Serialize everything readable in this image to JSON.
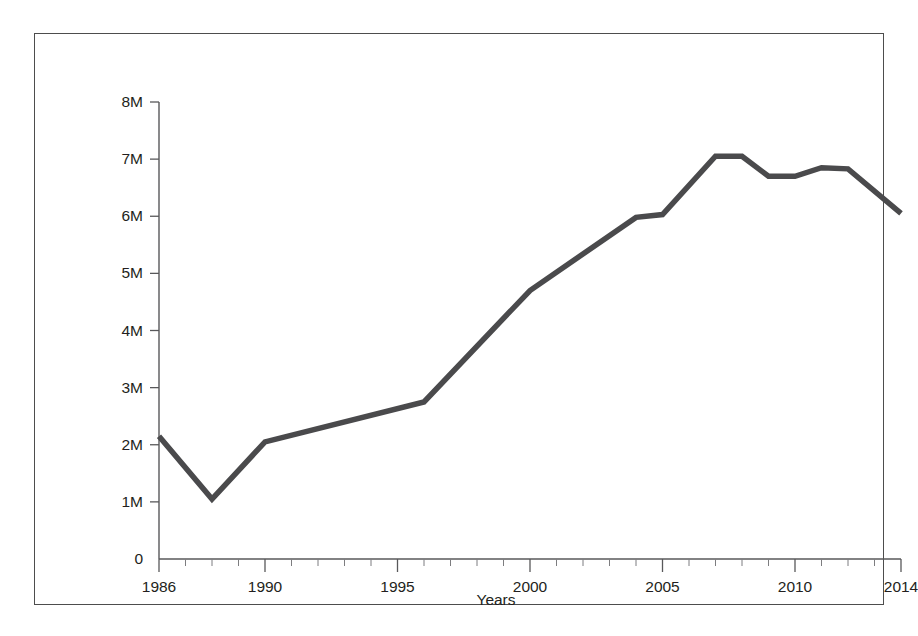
{
  "chart_data": {
    "type": "line",
    "title": "",
    "subtitle": "",
    "xlabel": "Years",
    "ylabel": "",
    "xlim": [
      1986,
      2014
    ],
    "ylim": [
      0,
      8000000
    ],
    "grid": false,
    "legend": null,
    "y_tick_values": [
      0,
      1000000,
      2000000,
      3000000,
      4000000,
      5000000,
      6000000,
      7000000,
      8000000
    ],
    "y_tick_labels": [
      "0",
      "1M",
      "2M",
      "3M",
      "4M",
      "5M",
      "6M",
      "7M",
      "8M"
    ],
    "x_tick_values": [
      1986,
      1990,
      1995,
      2000,
      2005,
      2010,
      2014
    ],
    "x_tick_labels": [
      "1986",
      "1990",
      "1995",
      "2000",
      "2005",
      "2010",
      "2014"
    ],
    "x_minor_ticks": [
      1987,
      1988,
      1989,
      1991,
      1992,
      1993,
      1994,
      1996,
      1997,
      1998,
      1999,
      2001,
      2002,
      2003,
      2004,
      2006,
      2007,
      2008,
      2009,
      2011,
      2012,
      2013
    ],
    "line_color": "#4a4a4c",
    "line_width": 5.5,
    "series": [
      {
        "name": "Series 1",
        "x": [
          1986,
          1988,
          1990,
          1996,
          2000,
          2004,
          2005,
          2007,
          2008,
          2009,
          2010,
          2011,
          2012,
          2014
        ],
        "values": [
          2150000,
          1050000,
          2050000,
          2750000,
          4700000,
          5980000,
          6030000,
          7050000,
          7050000,
          6700000,
          6700000,
          6850000,
          6830000,
          6050000
        ]
      }
    ]
  },
  "figure": {
    "border_color": "#4d4d4d",
    "background": "#ffffff",
    "axis_color": "#58585a"
  }
}
